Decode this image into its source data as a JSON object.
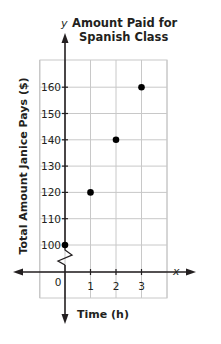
{
  "chart_data": {
    "type": "scatter",
    "title": "Amount Paid for Spanish Class",
    "title_lines": [
      "Amount Paid for",
      "Spanish Class"
    ],
    "xlabel": "Time (h)",
    "ylabel": "Total Amount Janice Pays ($)",
    "x_axis_letter": "x",
    "y_axis_letter": "y",
    "x": [
      0,
      1,
      2,
      3
    ],
    "y": [
      100,
      120,
      140,
      160
    ],
    "points": [
      {
        "x": 0,
        "y": 100
      },
      {
        "x": 1,
        "y": 120
      },
      {
        "x": 2,
        "y": 140
      },
      {
        "x": 3,
        "y": 160
      }
    ],
    "x_ticks": [
      "0",
      "1",
      "2",
      "3"
    ],
    "y_ticks": [
      "100",
      "110",
      "120",
      "130",
      "140",
      "150",
      "160"
    ],
    "xlim": [
      -1,
      4
    ],
    "ylim": [
      100,
      160
    ],
    "y_axis_break": true,
    "grid": true,
    "legend": null,
    "colors": {
      "axis": "#231f20",
      "grid": "#c8c8c8",
      "point": "#000000"
    }
  }
}
